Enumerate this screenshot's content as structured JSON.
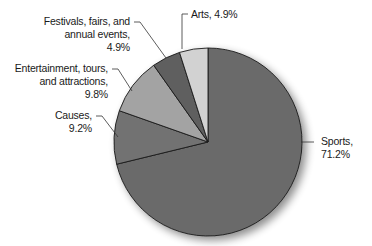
{
  "chart_data": {
    "type": "pie",
    "title": "",
    "start_angle_deg": 0,
    "direction": "clockwise",
    "slices": [
      {
        "name": "Sports",
        "value": 71.2,
        "label_lines": [
          "Sports,",
          "71.2%"
        ],
        "color": "#6b6b6b"
      },
      {
        "name": "Causes",
        "value": 9.2,
        "label_lines": [
          "Causes,",
          "9.2%"
        ],
        "color": "#727272"
      },
      {
        "name": "Entertainment, tours, and attractions",
        "value": 9.8,
        "label_lines": [
          "Entertainment, tours,",
          "and attractions,",
          "9.8%"
        ],
        "color": "#a3a3a3"
      },
      {
        "name": "Festivals, fairs, and annual events",
        "value": 4.9,
        "label_lines": [
          "Festivals, fairs, and",
          "annual events,",
          "4.9%"
        ],
        "color": "#5e5e5e"
      },
      {
        "name": "Arts",
        "value": 4.9,
        "label_lines": [
          "Arts, 4.9%"
        ],
        "color": "#d2d2d2"
      }
    ],
    "legend": "none",
    "labels_position": "outside with leader lines"
  }
}
